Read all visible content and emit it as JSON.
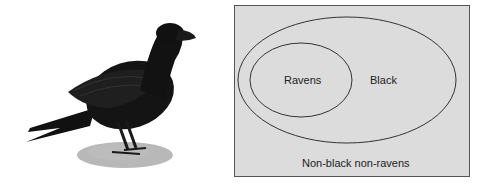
{
  "illustration": {
    "subject": "raven-illustration"
  },
  "venn": {
    "background": "#dcdcdc",
    "border": "#555555",
    "inner_label": "Ravens",
    "outer_label": "Black",
    "outside_label": "Non-black non-ravens"
  }
}
